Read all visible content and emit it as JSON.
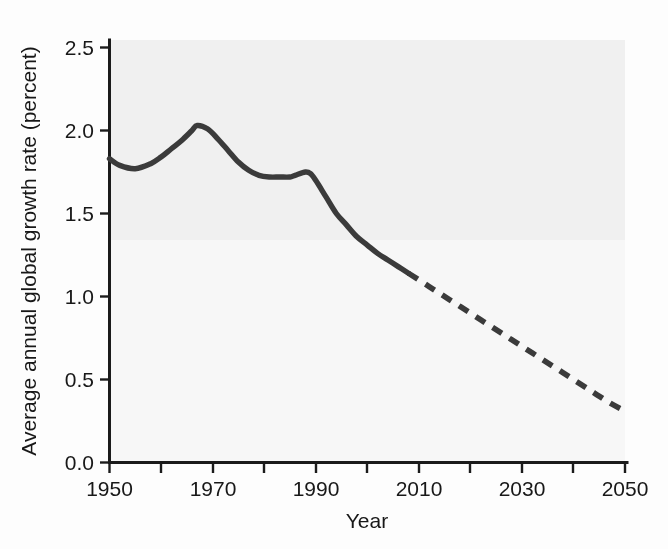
{
  "chart_data": {
    "type": "line",
    "title": "",
    "xlabel": "Year",
    "ylabel": "Average annual global growth rate (percent)",
    "xlim": [
      1950,
      2050
    ],
    "ylim": [
      0.0,
      2.5
    ],
    "grid": false,
    "legend_position": "none",
    "x_ticks": [
      1950,
      1960,
      1970,
      1980,
      1990,
      2000,
      2010,
      2020,
      2030,
      2040,
      2050
    ],
    "x_tick_labels": [
      "1950",
      "",
      "1970",
      "",
      "1990",
      "",
      "2010",
      "",
      "2030",
      "",
      "2050"
    ],
    "y_ticks": [
      0.0,
      0.5,
      1.0,
      1.5,
      2.0,
      2.5
    ],
    "y_tick_labels": [
      "0.0",
      "0.5",
      "1.0",
      "1.5",
      "2.0",
      "2.5"
    ],
    "series": [
      {
        "name": "Observed average annual global growth rate",
        "style": "solid",
        "color": "#3b3b3b",
        "x": [
          1950,
          1952,
          1955,
          1958,
          1960,
          1962,
          1964,
          1966,
          1967,
          1969,
          1971,
          1973,
          1975,
          1977,
          1979,
          1981,
          1983,
          1985,
          1986,
          1988,
          1989,
          1990,
          1992,
          1994,
          1996,
          1998,
          2000,
          2002,
          2004,
          2006,
          2008
        ],
        "values": [
          1.83,
          1.79,
          1.77,
          1.8,
          1.84,
          1.89,
          1.94,
          2.0,
          2.03,
          2.01,
          1.95,
          1.88,
          1.81,
          1.76,
          1.73,
          1.72,
          1.72,
          1.72,
          1.73,
          1.75,
          1.74,
          1.7,
          1.6,
          1.5,
          1.43,
          1.36,
          1.31,
          1.26,
          1.22,
          1.18,
          1.14
        ]
      },
      {
        "name": "Projected average annual global growth rate",
        "style": "dashed",
        "color": "#3b3b3b",
        "x": [
          2008,
          2012,
          2016,
          2020,
          2024,
          2028,
          2032,
          2036,
          2040,
          2044,
          2047,
          2050
        ],
        "values": [
          1.14,
          1.06,
          0.98,
          0.9,
          0.82,
          0.74,
          0.66,
          0.58,
          0.5,
          0.42,
          0.36,
          0.31
        ]
      }
    ],
    "annotations": [
      {
        "name": "inset-photograph",
        "description": "Black-and-white photograph of a dense crowd of people filling a street",
        "x_range": [
          1956,
          1992
        ],
        "y_range": [
          0.1,
          1.27
        ]
      }
    ]
  },
  "axes": {
    "x_axis_label": "Year",
    "y_axis_label": "Average annual global growth rate (percent)"
  },
  "inset": {
    "caption": "",
    "alt": "Crowd of people"
  }
}
